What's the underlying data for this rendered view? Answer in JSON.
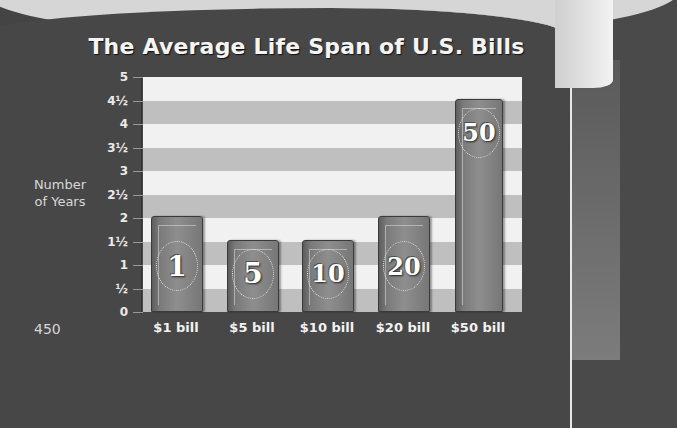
{
  "page": {
    "page_number": "450"
  },
  "chart_data": {
    "type": "bar",
    "title": "The Average Life Span of U.S. Bills",
    "xlabel": "",
    "ylabel": "Number of Years",
    "categories": [
      "$1 bill",
      "$5 bill",
      "$10 bill",
      "$20 bill",
      "$50 bill"
    ],
    "values": [
      2,
      1.5,
      1.5,
      2,
      4.5
    ],
    "bar_badges": [
      "1",
      "5",
      "10",
      "20",
      "50"
    ],
    "ylim": [
      0,
      5
    ],
    "yticks": [
      0,
      0.5,
      1,
      1.5,
      2,
      2.5,
      3,
      3.5,
      4,
      4.5,
      5
    ],
    "ytick_labels": [
      "0",
      "½",
      "1",
      "1½",
      "2",
      "2½",
      "3",
      "3½",
      "4",
      "4½",
      "5"
    ],
    "grid": "horizontal alternating bands",
    "legend": "none",
    "colors": {
      "band_light": "#f1f1f1",
      "band_dark": "#bfbfbf",
      "bar": "#7a7a7a",
      "background": "#474747"
    }
  }
}
